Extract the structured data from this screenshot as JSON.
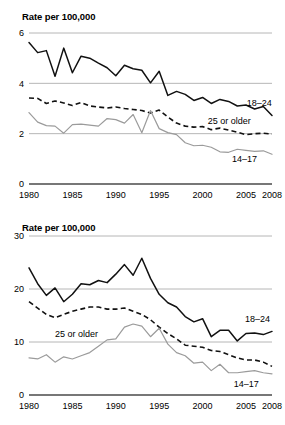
{
  "chart_data": [
    {
      "id": "top",
      "type": "line",
      "title": "Rate per 100,000",
      "xlabel": "",
      "ylabel": "Rate per 100,000",
      "xlim": [
        1980,
        2008
      ],
      "ylim": [
        0,
        6
      ],
      "yticks": [
        0,
        2,
        4,
        6
      ],
      "ytick_labels": [
        "0",
        "2",
        "4",
        "6"
      ],
      "xticks": [
        1980,
        1985,
        1990,
        1995,
        2000,
        2005,
        2008
      ],
      "xtick_labels": [
        "1980",
        "1985",
        "1990",
        "1995",
        "2000",
        "2005",
        "2008"
      ],
      "grid": "horizontal",
      "legend_position": "inline-right",
      "x": [
        1980,
        1981,
        1982,
        1983,
        1984,
        1985,
        1986,
        1987,
        1988,
        1989,
        1990,
        1991,
        1992,
        1993,
        1994,
        1995,
        1996,
        1997,
        1998,
        1999,
        2000,
        2001,
        2002,
        2003,
        2004,
        2005,
        2006,
        2007,
        2008
      ],
      "series": [
        {
          "name": "18-24",
          "label": "18–24",
          "style": "solid",
          "color": "#111111",
          "label_x": 2005.1,
          "label_y": 3.22,
          "values": [
            5.62,
            5.22,
            5.3,
            4.28,
            5.4,
            4.42,
            5.08,
            5.0,
            4.8,
            4.62,
            4.3,
            4.72,
            4.58,
            4.52,
            4.02,
            4.48,
            3.52,
            3.68,
            3.56,
            3.32,
            3.44,
            3.2,
            3.36,
            3.28,
            3.1,
            3.14,
            2.98,
            3.08,
            2.72
          ]
        },
        {
          "name": "25 or older",
          "label": "25 or older",
          "style": "dashed",
          "color": "#111111",
          "label_x": 2000.6,
          "label_y": 2.52,
          "values": [
            3.42,
            3.4,
            3.2,
            3.3,
            3.22,
            3.12,
            3.24,
            3.1,
            3.06,
            3.02,
            3.06,
            3.0,
            2.96,
            2.92,
            2.82,
            2.94,
            2.66,
            2.42,
            2.3,
            2.26,
            2.28,
            2.16,
            2.22,
            2.14,
            2.06,
            1.96,
            2.0,
            2.02,
            1.98
          ]
        },
        {
          "name": "14-17",
          "label": "14–17",
          "style": "gray",
          "color": "#9b9b9b",
          "label_x": 2003.4,
          "label_y": 1.02,
          "values": [
            2.84,
            2.46,
            2.32,
            2.3,
            2.02,
            2.36,
            2.38,
            2.34,
            2.3,
            2.6,
            2.56,
            2.42,
            2.76,
            2.04,
            2.92,
            2.2,
            2.04,
            1.96,
            1.64,
            1.52,
            1.54,
            1.46,
            1.28,
            1.26,
            1.38,
            1.34,
            1.3,
            1.32,
            1.18
          ]
        }
      ]
    },
    {
      "id": "bottom",
      "type": "line",
      "title": "Rate per 100,000",
      "xlabel": "",
      "ylabel": "Rate per 100,000",
      "xlim": [
        1980,
        2008
      ],
      "ylim": [
        0,
        30
      ],
      "yticks": [
        0,
        10,
        20,
        30
      ],
      "ytick_labels": [
        "0",
        "10",
        "20",
        "30"
      ],
      "xticks": [
        1980,
        1985,
        1990,
        1995,
        2000,
        2005,
        2008
      ],
      "xtick_labels": [
        "1980",
        "1985",
        "1990",
        "1995",
        "2000",
        "2005",
        "2008"
      ],
      "grid": "horizontal",
      "legend_position": "inline-right",
      "x": [
        1980,
        1981,
        1982,
        1983,
        1984,
        1985,
        1986,
        1987,
        1988,
        1989,
        1990,
        1991,
        1992,
        1993,
        1994,
        1995,
        1996,
        1997,
        1998,
        1999,
        2000,
        2001,
        2002,
        2003,
        2004,
        2005,
        2006,
        2007,
        2008
      ],
      "series": [
        {
          "name": "18-24",
          "label": "18–24",
          "style": "solid",
          "color": "#111111",
          "label_x": 2004.9,
          "label_y": 14.3,
          "values": [
            24.0,
            21.0,
            18.8,
            20.2,
            17.6,
            19.0,
            21.0,
            20.8,
            21.6,
            21.2,
            22.8,
            24.6,
            22.6,
            25.8,
            22.0,
            19.0,
            17.4,
            16.6,
            14.8,
            13.8,
            14.4,
            11.0,
            12.2,
            12.2,
            10.2,
            11.6,
            11.7,
            11.4,
            12.0
          ]
        },
        {
          "name": "25 or older",
          "label": "25 or older",
          "style": "dashed",
          "color": "#111111",
          "label_x": 1983.0,
          "label_y": 11.6,
          "values": [
            17.6,
            16.4,
            15.2,
            14.6,
            15.2,
            15.8,
            16.2,
            16.6,
            16.6,
            16.2,
            16.2,
            16.4,
            15.8,
            15.2,
            14.2,
            12.8,
            11.6,
            10.6,
            9.4,
            9.2,
            9.0,
            8.4,
            8.2,
            7.6,
            7.0,
            6.6,
            6.6,
            6.2,
            5.4
          ]
        },
        {
          "name": "14-17",
          "label": "14–17",
          "style": "gray",
          "color": "#9b9b9b",
          "label_x": 2003.6,
          "label_y": 2.2,
          "values": [
            7.0,
            6.8,
            7.6,
            6.2,
            7.2,
            6.8,
            7.4,
            8.0,
            9.2,
            10.4,
            10.6,
            12.8,
            13.4,
            13.0,
            11.0,
            12.6,
            9.6,
            8.0,
            7.4,
            6.0,
            6.2,
            4.6,
            5.8,
            4.2,
            4.2,
            4.4,
            4.6,
            4.2,
            4.0
          ]
        }
      ]
    }
  ]
}
